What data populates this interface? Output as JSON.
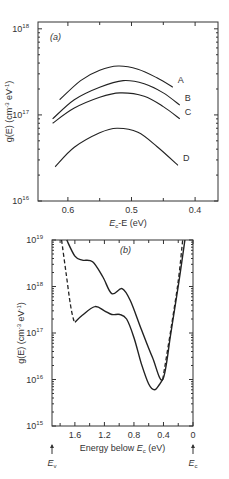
{
  "chart_data": [
    {
      "type": "line",
      "panel_label": "(a)",
      "xlabel": "E_c - E (eV)",
      "xlabel_parts": {
        "main": "E",
        "sub": "c",
        "rest": "-E (eV)"
      },
      "ylabel": "g(E) (cm^-3 eV^-1)",
      "ylabel_text": "g(E) (cm",
      "ylabel_sup1": "-3",
      "ylabel_mid": " eV",
      "ylabel_sup2": "-1",
      "ylabel_end": ")",
      "yscale": "log",
      "xlim": [
        0.647,
        0.364
      ],
      "x_reversed": true,
      "ylim": [
        1e+16,
        1.2e+18
      ],
      "xticks": [
        0.6,
        0.5,
        0.4
      ],
      "xtick_labels": [
        "0.6",
        "0.5",
        "0.4"
      ],
      "xminor": [
        0.55,
        0.45
      ],
      "yticks": [
        1e+16,
        1e+17,
        1e+18
      ],
      "ytick_labels": [
        {
          "base": "10",
          "exp": "16"
        },
        {
          "base": "10",
          "exp": "17"
        },
        {
          "base": "10",
          "exp": "18"
        }
      ],
      "grid": false,
      "series": [
        {
          "name": "A",
          "x": [
            0.613,
            0.58,
            0.55,
            0.521,
            0.49,
            0.46,
            0.435
          ],
          "y": [
            1.5e+17,
            2.5e+17,
            3.3e+17,
            3.7e+17,
            3.4e+17,
            2.7e+17,
            2.1e+17
          ]
        },
        {
          "name": "B",
          "x": [
            0.624,
            0.59,
            0.55,
            0.513,
            0.48,
            0.45,
            0.424
          ],
          "y": [
            9e+16,
            1.5e+17,
            2.1e+17,
            2.5e+17,
            2.3e+17,
            1.8e+17,
            1.3e+17
          ]
        },
        {
          "name": "C",
          "x": [
            0.624,
            0.59,
            0.55,
            0.518,
            0.48,
            0.45,
            0.424
          ],
          "y": [
            8e+16,
            1.2e+17,
            1.6e+17,
            1.8e+17,
            1.65e+17,
            1.25e+17,
            9e+16
          ]
        },
        {
          "name": "D",
          "x": [
            0.62,
            0.59,
            0.55,
            0.523,
            0.49,
            0.46,
            0.427
          ],
          "y": [
            2.5e+16,
            4.2e+16,
            6.2e+16,
            7e+16,
            6.3e+16,
            4.3e+16,
            2.6e+16
          ]
        }
      ]
    },
    {
      "type": "line",
      "panel_label": "(b)",
      "xlabel": "Energy below E_c (eV)",
      "xlabel_parts": {
        "main": "Energy below ",
        "sym": "E",
        "sub": "c",
        "rest": " (eV)"
      },
      "ylabel": "g(E) (cm^-3 eV^-1)",
      "yscale": "log",
      "xlim": [
        1.91,
        0
      ],
      "x_reversed": true,
      "ylim": [
        1000000000000000.0,
        1e+19
      ],
      "xticks": [
        1.6,
        1.2,
        0.8,
        0.4,
        0
      ],
      "xtick_labels": [
        "1.6",
        "1.2",
        "0.8",
        "0.4",
        "0"
      ],
      "xminor": [
        1.8,
        1.4,
        1.0,
        0.6,
        0.2
      ],
      "yticks": [
        1000000000000000.0,
        1e+16,
        1e+17,
        1e+18,
        1e+19
      ],
      "ytick_labels": [
        {
          "base": "10",
          "exp": "15"
        },
        {
          "base": "10",
          "exp": "16"
        },
        {
          "base": "10",
          "exp": "17"
        },
        {
          "base": "10",
          "exp": "18"
        },
        {
          "base": "10",
          "exp": "19"
        }
      ],
      "annotations": [
        {
          "text": "E",
          "sub": "v",
          "at_x": 1.91,
          "arrow": "up"
        },
        {
          "text": "E",
          "sub": "c",
          "at_x": 0,
          "arrow": "up"
        }
      ],
      "grid": false,
      "series": [
        {
          "name": "upper-solid",
          "style": "solid",
          "x": [
            1.71,
            1.6,
            1.5,
            1.36,
            1.22,
            1.1,
            0.96,
            0.85,
            0.7,
            0.55,
            0.41,
            0.3,
            0.2,
            0.11
          ],
          "y": [
            1e+19,
            4.5e+18,
            3.7e+18,
            3.4e+18,
            1.6e+18,
            7e+17,
            9e+17,
            5e+17,
            1.2e+17,
            3e+16,
            1e+16,
            1e+17,
            1e+18,
            1e+19
          ]
        },
        {
          "name": "lower-solid",
          "style": "solid",
          "x": [
            1.6,
            1.5,
            1.33,
            1.2,
            1.1,
            0.99,
            0.9,
            0.8,
            0.7,
            0.6,
            0.52,
            0.45,
            0.41
          ],
          "y": [
            1.7e+17,
            2.4e+17,
            3.7e+17,
            3e+17,
            2.5e+17,
            2.5e+17,
            2e+17,
            8e+16,
            2.2e+16,
            8000000000000000.0,
            6000000000000000.0,
            8000000000000000.0,
            1e+16
          ]
        },
        {
          "name": "dashed",
          "style": "dashed",
          "x": [
            1.78,
            1.72,
            1.66,
            1.62,
            1.6
          ],
          "y": [
            1e+19,
            2e+18,
            4e+17,
            2e+17,
            1.7e+17
          ]
        },
        {
          "name": "dashed-right",
          "style": "dashed",
          "x": [
            0.41,
            0.3,
            0.2,
            0.14
          ],
          "y": [
            1e+16,
            1.2e+17,
            1.3e+18,
            1e+19
          ]
        }
      ]
    }
  ]
}
